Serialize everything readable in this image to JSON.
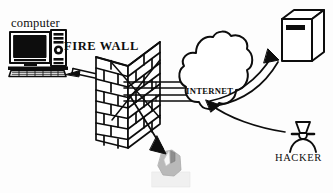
{
  "diagram": {
    "background_color": "#fdfdfd",
    "ink_color": "#0d0d0d",
    "labels": {
      "computer": "computer",
      "firewall": "FIRE WALL",
      "internet": "INTERNET",
      "hacker": "HACKER"
    },
    "nodes": [
      {
        "id": "computer",
        "icon": "desktop-computer-icon",
        "label": "computer",
        "description": "CRT monitor with dark screen, tower case and keyboard",
        "position": "left"
      },
      {
        "id": "firewall",
        "icon": "brick-wall-icon",
        "label": "FIRE WALL",
        "description": "Isometric brick wall barrier",
        "position": "left-center"
      },
      {
        "id": "internet",
        "icon": "cloud-icon",
        "label": "INTERNET",
        "description": "Irregular cloud shape representing the internet",
        "position": "center-right"
      },
      {
        "id": "server",
        "icon": "server-box-icon",
        "label": "",
        "description": "Three dimensional server cabinet with dark slot",
        "position": "top-right"
      },
      {
        "id": "hacker",
        "icon": "masked-person-icon",
        "label": "HACKER",
        "description": "Person wearing a hat and eye mask",
        "position": "bottom-right"
      },
      {
        "id": "blocked-device",
        "icon": "gray-mouse-icon",
        "label": "",
        "description": "Faded gray device targeted by a blocked arrow",
        "position": "bottom-center"
      }
    ],
    "connections": [
      {
        "id": "computer-to-firewall",
        "from": "computer",
        "to": "firewall",
        "style": "double-line-pipe",
        "arrow": true
      },
      {
        "id": "firewall-to-internet",
        "from": "firewall",
        "to": "internet",
        "style": "double-line-pipe",
        "arrow": false
      },
      {
        "id": "internet-to-server",
        "from": "internet",
        "to": "server",
        "style": "double-line-pipe",
        "arrow": true
      },
      {
        "id": "hacker-to-internet",
        "from": "hacker",
        "to": "internet",
        "style": "single-curve",
        "arrow": true
      },
      {
        "id": "firewall-to-blocked-device",
        "from": "firewall",
        "to": "blocked-device",
        "style": "single-line",
        "arrow": true
      }
    ]
  }
}
